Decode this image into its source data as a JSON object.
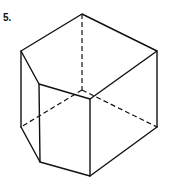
{
  "figure": {
    "label": "5.",
    "vertices": {
      "top_back": [
        82,
        14
      ],
      "top_left": [
        21,
        51
      ],
      "top_inner_left": [
        39,
        84
      ],
      "top_front": [
        90,
        99
      ],
      "top_right": [
        157,
        51
      ],
      "hidden_center": [
        82,
        90
      ],
      "bottom_left": [
        21,
        127
      ],
      "bottom_inner_left": [
        40,
        162
      ],
      "bottom_front": [
        90,
        176
      ],
      "bottom_right": [
        157,
        127
      ]
    },
    "line_color": "#111111"
  }
}
